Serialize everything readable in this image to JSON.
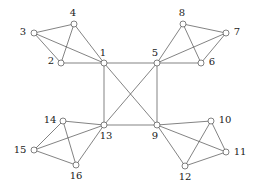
{
  "figure": {
    "kind": "undirected-graph-diagram",
    "width": 260,
    "height": 187,
    "background_color": "#ffffff",
    "edge_color": "#4d4d4d",
    "vertex_fill_color": "#ffffff",
    "vertex_stroke_color": "#4d4d4d",
    "label_color": "#1a1a1a",
    "vertex_count": 16,
    "edge_count": 28
  },
  "chart_data": {
    "type": "diagram",
    "subtype": "graph",
    "title": "",
    "xlabel": "",
    "ylabel": "",
    "directed": false,
    "weighted": false,
    "nodes": [
      {
        "id": "1",
        "label": "1",
        "x": 104,
        "y": 63,
        "label_dx": -1,
        "label_dy": -10,
        "r": 3.0
      },
      {
        "id": "2",
        "label": "2",
        "x": 61,
        "y": 63,
        "label_dx": -10,
        "label_dy": -2,
        "r": 3.0
      },
      {
        "id": "3",
        "label": "3",
        "x": 34,
        "y": 33,
        "label_dx": -11,
        "label_dy": -1,
        "r": 3.0
      },
      {
        "id": "4",
        "label": "4",
        "x": 74,
        "y": 24,
        "label_dx": -1,
        "label_dy": -11,
        "r": 3.0
      },
      {
        "id": "5",
        "label": "5",
        "x": 157,
        "y": 63,
        "label_dx": -2,
        "label_dy": -10,
        "r": 3.0
      },
      {
        "id": "6",
        "label": "6",
        "x": 201,
        "y": 63,
        "label_dx": 11,
        "label_dy": -1,
        "r": 3.0
      },
      {
        "id": "7",
        "label": "7",
        "x": 226,
        "y": 33,
        "label_dx": 11,
        "label_dy": -1,
        "r": 3.0
      },
      {
        "id": "8",
        "label": "8",
        "x": 183,
        "y": 24,
        "label_dx": -1,
        "label_dy": -11,
        "r": 3.0
      },
      {
        "id": "9",
        "label": "9",
        "x": 157,
        "y": 125,
        "label_dx": -2,
        "label_dy": 11,
        "r": 3.0
      },
      {
        "id": "10",
        "label": "10",
        "x": 211,
        "y": 121,
        "label_dx": 14,
        "label_dy": -1,
        "r": 3.0
      },
      {
        "id": "11",
        "label": "11",
        "x": 226,
        "y": 152,
        "label_dx": 14,
        "label_dy": 0,
        "r": 3.0
      },
      {
        "id": "12",
        "label": "12",
        "x": 185,
        "y": 166,
        "label_dx": 0,
        "label_dy": 11,
        "r": 3.0
      },
      {
        "id": "13",
        "label": "13",
        "x": 104,
        "y": 125,
        "label_dx": 2,
        "label_dy": 11,
        "r": 3.0
      },
      {
        "id": "14",
        "label": "14",
        "x": 63,
        "y": 121,
        "label_dx": -13,
        "label_dy": -1,
        "r": 3.0
      },
      {
        "id": "15",
        "label": "15",
        "x": 34,
        "y": 150,
        "label_dx": -14,
        "label_dy": 0,
        "r": 3.0
      },
      {
        "id": "16",
        "label": "16",
        "x": 76,
        "y": 165,
        "label_dx": 0,
        "label_dy": 11,
        "r": 3.0
      }
    ],
    "edges": [
      {
        "source": "1",
        "target": "2",
        "group": "cluster-top-left"
      },
      {
        "source": "1",
        "target": "3",
        "group": "cluster-top-left"
      },
      {
        "source": "1",
        "target": "4",
        "group": "cluster-top-left"
      },
      {
        "source": "2",
        "target": "3",
        "group": "cluster-top-left"
      },
      {
        "source": "2",
        "target": "4",
        "group": "cluster-top-left"
      },
      {
        "source": "3",
        "target": "4",
        "group": "cluster-top-left"
      },
      {
        "source": "5",
        "target": "6",
        "group": "cluster-top-right"
      },
      {
        "source": "5",
        "target": "7",
        "group": "cluster-top-right"
      },
      {
        "source": "5",
        "target": "8",
        "group": "cluster-top-right"
      },
      {
        "source": "6",
        "target": "7",
        "group": "cluster-top-right"
      },
      {
        "source": "6",
        "target": "8",
        "group": "cluster-top-right"
      },
      {
        "source": "7",
        "target": "8",
        "group": "cluster-top-right"
      },
      {
        "source": "9",
        "target": "10",
        "group": "cluster-bottom-right"
      },
      {
        "source": "9",
        "target": "11",
        "group": "cluster-bottom-right"
      },
      {
        "source": "9",
        "target": "12",
        "group": "cluster-bottom-right"
      },
      {
        "source": "10",
        "target": "11",
        "group": "cluster-bottom-right"
      },
      {
        "source": "10",
        "target": "12",
        "group": "cluster-bottom-right"
      },
      {
        "source": "11",
        "target": "12",
        "group": "cluster-bottom-right"
      },
      {
        "source": "13",
        "target": "14",
        "group": "cluster-bottom-left"
      },
      {
        "source": "13",
        "target": "15",
        "group": "cluster-bottom-left"
      },
      {
        "source": "13",
        "target": "16",
        "group": "cluster-bottom-left"
      },
      {
        "source": "14",
        "target": "15",
        "group": "cluster-bottom-left"
      },
      {
        "source": "14",
        "target": "16",
        "group": "cluster-bottom-left"
      },
      {
        "source": "15",
        "target": "16",
        "group": "cluster-bottom-left"
      },
      {
        "source": "1",
        "target": "5",
        "group": "core"
      },
      {
        "source": "1",
        "target": "13",
        "group": "core"
      },
      {
        "source": "5",
        "target": "9",
        "group": "core"
      },
      {
        "source": "9",
        "target": "13",
        "group": "core"
      },
      {
        "source": "1",
        "target": "9",
        "group": "core-diagonal"
      },
      {
        "source": "5",
        "target": "13",
        "group": "core-diagonal"
      }
    ]
  }
}
